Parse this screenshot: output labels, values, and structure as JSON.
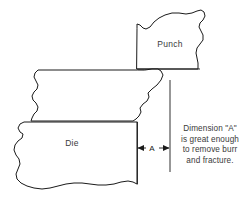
{
  "diagram": {
    "background_color": "#ffffff",
    "line_color": "#1a1a1a",
    "text_color": "#3a3a3a",
    "parts": [
      {
        "id": "punch",
        "label": "Punch",
        "label_x": 170,
        "label_y": 47
      },
      {
        "id": "die",
        "label": "Die",
        "label_x": 72,
        "label_y": 146
      },
      {
        "id": "strip",
        "label": "",
        "label_x": 0,
        "label_y": 0
      }
    ],
    "dimension": {
      "label": "A",
      "label_x": 152,
      "label_y": 151,
      "left_extension_x": 137,
      "right_extension_x": 170,
      "dimension_line_y": 148
    },
    "note": {
      "lines": [
        "Dimension \"A\"",
        "is great enough",
        "to remove burr",
        "and fracture."
      ]
    }
  }
}
